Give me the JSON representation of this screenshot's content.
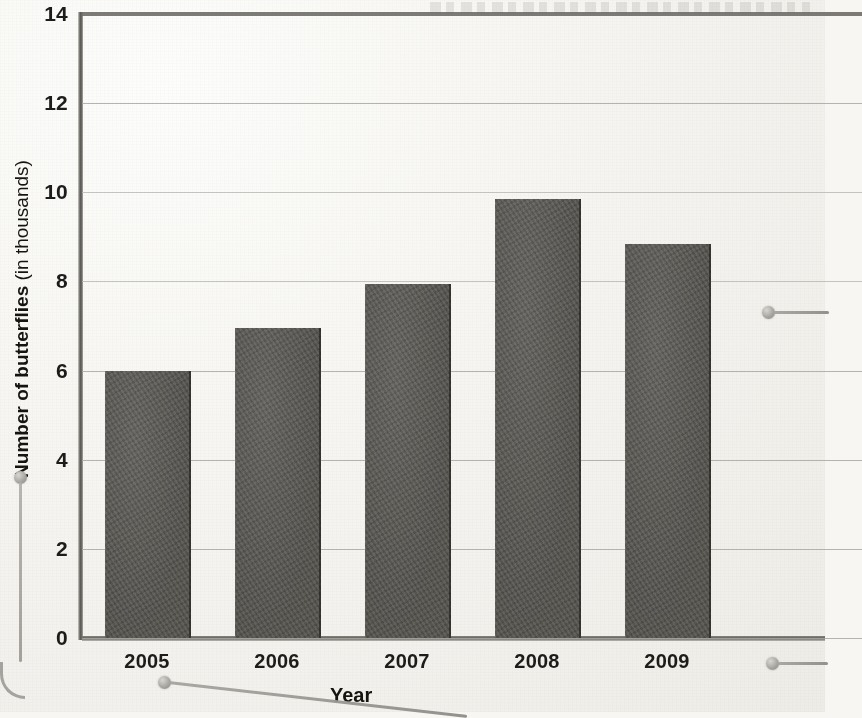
{
  "chart_data": {
    "type": "bar",
    "title": "",
    "xlabel": "Year",
    "ylabel": "Number of butterflies (in thousands)",
    "ylabel_bold_part": "Number of butterflies",
    "ylabel_light_part": "(in thousands)",
    "categories": [
      "2005",
      "2006",
      "2007",
      "2008",
      "2009"
    ],
    "values": [
      6.0,
      6.95,
      7.95,
      9.85,
      8.85
    ],
    "yticks": [
      "0",
      "2",
      "4",
      "6",
      "8",
      "10",
      "12",
      "14"
    ],
    "ytick_values": [
      0,
      2,
      4,
      6,
      8,
      10,
      12,
      14
    ],
    "ylim": [
      0,
      14
    ],
    "grid": "horizontal",
    "legend": "none",
    "bar_color": "#575550",
    "gridline_color": "#a9a7a1",
    "axis_color": "#5d5b56",
    "background_color": "#f4f3ef",
    "note": "Chart is cropped at the right edge of the page; a sixth category slot is partially visible."
  },
  "axis": {
    "y_label_bold": "Number of butterflies",
    "y_label_light": "(in thousands)",
    "x_label": "Year"
  },
  "annotations": {
    "callouts": [
      {
        "name": "y-axis-callout",
        "target": "Number of butterflies (in thousands)"
      },
      {
        "name": "x-axis-2005-callout",
        "target": "2005"
      },
      {
        "name": "bar-2009-callout",
        "target": "2009 bar"
      },
      {
        "name": "x-tick-2009-callout",
        "target": "2009 label"
      }
    ]
  }
}
